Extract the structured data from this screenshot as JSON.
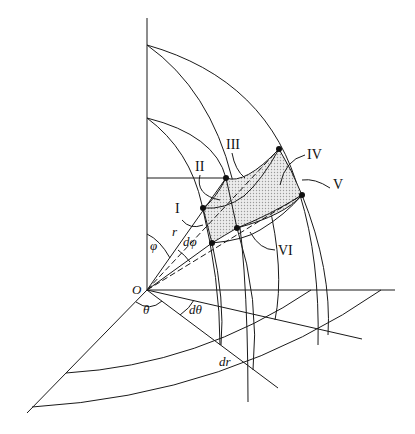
{
  "figure": {
    "origin_label": "O",
    "angle_labels": {
      "phi": "φ",
      "dphi": "dφ",
      "theta": "θ",
      "dtheta": "dθ"
    },
    "length_labels": {
      "r": "r",
      "dr": "dr"
    },
    "face_labels": [
      "I",
      "II",
      "III",
      "IV",
      "V",
      "VI"
    ],
    "colors": {
      "line": "#1a1a1a",
      "shaded_element": "#d9d9d9",
      "background": "#ffffff"
    }
  }
}
